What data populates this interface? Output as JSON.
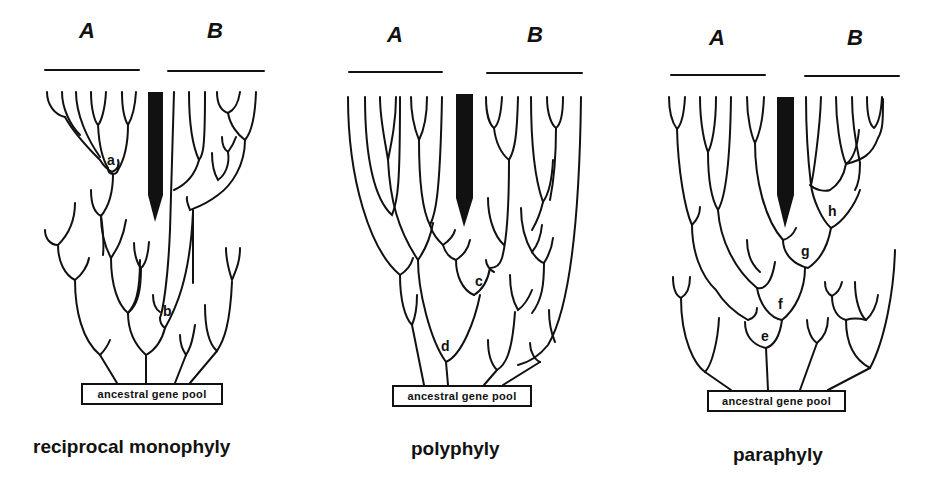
{
  "panels": [
    {
      "id": "reciprocal-monophyly",
      "group_a": "A",
      "group_b": "B",
      "node_labels": [
        "a",
        "b"
      ],
      "pool_label": "ancestral gene pool",
      "caption": "reciprocal monophyly"
    },
    {
      "id": "polyphyly",
      "group_a": "A",
      "group_b": "B",
      "node_labels": [
        "c",
        "d"
      ],
      "pool_label": "ancestral gene pool",
      "caption": "polyphyly"
    },
    {
      "id": "paraphyly",
      "group_a": "A",
      "group_b": "B",
      "node_labels": [
        "h",
        "g",
        "f",
        "e"
      ],
      "pool_label": "ancestral gene pool",
      "caption": "paraphyly"
    }
  ],
  "colors": {
    "line": "#111111",
    "background": "#ffffff",
    "barrier": "#111111"
  }
}
